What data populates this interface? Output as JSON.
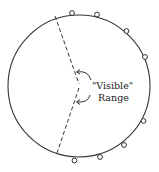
{
  "diagram": {
    "label_line1": "\"Visible\"",
    "label_line2": "Range",
    "colors": {
      "stroke": "#333333",
      "background": "#ffffff",
      "marker_fill": "#ffffff"
    },
    "circle": {
      "cx": 79,
      "cy": 86,
      "r": 71
    },
    "visible_range_apex": {
      "x": 79,
      "y": 85
    },
    "boundary_points": [
      {
        "x": 55,
        "y": 16
      },
      {
        "x": 56,
        "y": 156
      }
    ],
    "markers": [
      {
        "x": 72,
        "y": 13
      },
      {
        "x": 97,
        "y": 14
      },
      {
        "x": 126,
        "y": 31
      },
      {
        "x": 145,
        "y": 57
      },
      {
        "x": 143,
        "y": 121
      },
      {
        "x": 124,
        "y": 145
      },
      {
        "x": 100,
        "y": 157
      },
      {
        "x": 74,
        "y": 161
      }
    ]
  }
}
